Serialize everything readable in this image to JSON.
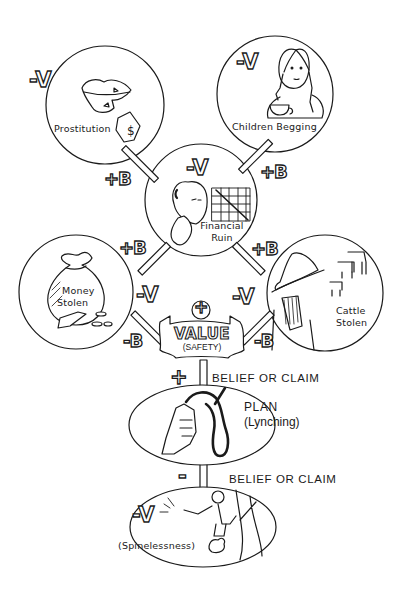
{
  "diagram": {
    "type": "value-belief-plan chain illustration",
    "stroke_color": "#1a1a1a",
    "background": "#ffffff",
    "nodes": {
      "prostitution": {
        "label": "Prostitution",
        "valence": "-V",
        "icon": "lips-and-money-tag"
      },
      "children_begging": {
        "label": "Children Begging",
        "valence": "-V",
        "icon": "girl-with-cup"
      },
      "financial_ruin": {
        "label_line1": "Financial",
        "label_line2": "Ruin",
        "valence": "-V",
        "icon": "crying-man-with-falling-chart"
      },
      "money_stolen": {
        "label_line1": "Money",
        "label_line2": "Stolen",
        "icon": "money-bag"
      },
      "cattle_stolen": {
        "label_line1": "Cattle",
        "label_line2": "Stolen",
        "icon": "bandit-with-cattle"
      },
      "value": {
        "label_line1": "VALUE",
        "label_line2": "(SAFETY)",
        "sign": "+",
        "icon": "banner-sign"
      },
      "plan": {
        "label_line1": "PLAN",
        "label_line2": "(Lynching)",
        "icon": "hand-holding-noose"
      },
      "spinelessness": {
        "label": "(Spinelessness)",
        "valence": "-V",
        "icon": "man-in-tree"
      }
    },
    "edges": {
      "prostitution_to_ruin": "+B",
      "begging_to_ruin": "+B",
      "money_to_ruin": "+B",
      "cattle_to_ruin": "+B",
      "money_valence": "-V",
      "cattle_valence": "-V",
      "money_to_value": "-B",
      "cattle_to_value": "-B",
      "value_to_plan": {
        "sign": "+",
        "label": "BELIEF OR CLAIM"
      },
      "plan_to_spinelessness": {
        "sign": "-",
        "label": "BELIEF OR CLAIM"
      }
    }
  }
}
